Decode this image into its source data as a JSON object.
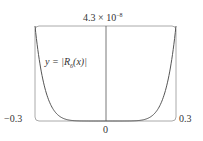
{
  "chart_data": {
    "type": "line",
    "title": "",
    "series": [
      {
        "name": "y = |R_6(x)|",
        "function": "c * x^7 (abs)",
        "x": [
          -0.3,
          -0.25,
          -0.2,
          -0.15,
          -0.1,
          -0.05,
          0,
          0.05,
          0.1,
          0.15,
          0.2,
          0.25,
          0.3
        ],
        "values": [
          4.3e-08,
          1.2e-08,
          2.5e-09,
          3.3e-10,
          2e-11,
          1.6e-13,
          0,
          1.6e-13,
          2e-11,
          3.3e-10,
          2.5e-09,
          1.2e-08,
          4.3e-08
        ]
      }
    ],
    "xlim": [
      -0.3,
      0.3
    ],
    "ylim": [
      0,
      4.3e-08
    ],
    "tick_labels": {
      "x_left": "−0.3",
      "x_center": "0",
      "x_right": "0.3",
      "y_top": "4.3 × 10⁻⁸"
    },
    "annotation": "y = |R₆(x)|",
    "grid": false,
    "legend": "none"
  },
  "labels": {
    "ymax": "4.3 × 10",
    "ymax_exp": "−8",
    "xmin": "−0.3",
    "xmax": "0.3",
    "xzero": "0",
    "curve_prefix": "y = |",
    "curve_R": "R",
    "curve_sub": "6",
    "curve_suffix": "(x)|"
  }
}
